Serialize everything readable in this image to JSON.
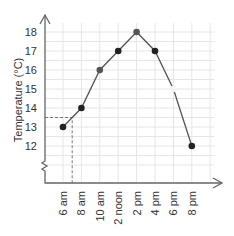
{
  "chart_data": {
    "type": "line",
    "title": "",
    "xlabel": "",
    "ylabel": "Temperature (°C)",
    "categories": [
      "6 am",
      "8 am",
      "10 am",
      "2 noon",
      "2 pm",
      "4 pm",
      "6 pm",
      "8 pm"
    ],
    "series": [
      {
        "name": "Temperature",
        "values": [
          13,
          14,
          16,
          17,
          18,
          17,
          15,
          12
        ]
      }
    ],
    "y_ticks": [
      12,
      13,
      14,
      15,
      16,
      17,
      18
    ],
    "ylim": [
      11,
      18.5
    ],
    "grid": true,
    "legend": null,
    "annotation": {
      "type": "dashed-guide",
      "x_label": "7 am",
      "y_value": 13.5
    }
  },
  "colors": {
    "line": "#555555",
    "point": "#222222",
    "grid": "#e6e6e6",
    "axis": "#666666"
  }
}
